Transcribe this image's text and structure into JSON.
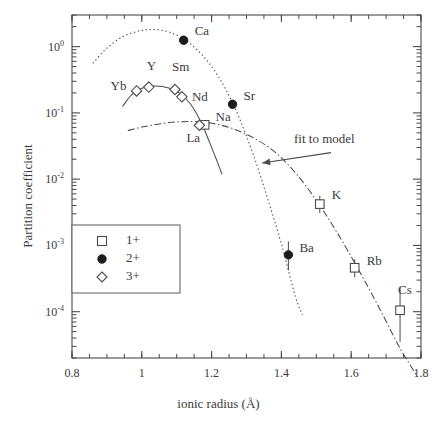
{
  "figure": {
    "xlabel": "ionic radius  (Å)",
    "ylabel": "Partition coefficient",
    "annotation": "fit to model"
  },
  "axes": {
    "x_ticks": [
      "0.8",
      "1",
      "1.2",
      "1.4",
      "1.6",
      "1.8"
    ],
    "x_tick_values": [
      0.8,
      1.0,
      1.2,
      1.4,
      1.6,
      1.8
    ],
    "y_ticks": [
      "10",
      "10",
      "10",
      "10",
      "10"
    ],
    "y_tick_exponents": [
      "0",
      "-1",
      "-2",
      "-3",
      "-4"
    ],
    "y_tick_values": [
      1,
      0.1,
      0.01,
      0.001,
      0.0001
    ]
  },
  "legend": {
    "items": [
      {
        "marker": "open-square",
        "label": "1+"
      },
      {
        "marker": "filled-circle",
        "label": "2+"
      },
      {
        "marker": "open-diamond",
        "label": "3+"
      }
    ]
  },
  "chart_data": {
    "type": "scatter",
    "title": "",
    "xlabel": "ionic radius  (Å)",
    "ylabel": "Partition coefficient",
    "xlim": [
      0.8,
      1.8
    ],
    "ylim": [
      2e-05,
      3.0
    ],
    "yscale": "log",
    "xscale": "linear",
    "grid": false,
    "legend_position": "lower-left",
    "annotations": [
      {
        "text": "fit to model",
        "x": 1.565,
        "y": 0.031,
        "arrow_to_x": 1.345,
        "arrow_to_y": 0.0175
      }
    ],
    "series": [
      {
        "name": "1+",
        "marker": "open-square",
        "points": [
          {
            "label": "Na",
            "x": 1.18,
            "y": 0.066,
            "yerr_low": null,
            "yerr_high": null
          },
          {
            "label": "K",
            "x": 1.51,
            "y": 0.0042,
            "yerr_low": 0.0031,
            "yerr_high": 0.0056
          },
          {
            "label": "Rb",
            "x": 1.61,
            "y": 0.00046,
            "yerr_low": 0.00033,
            "yerr_high": 0.00062
          },
          {
            "label": "Cs",
            "x": 1.74,
            "y": 0.000105,
            "yerr_low": 3.5e-05,
            "yerr_high": 0.00023
          }
        ]
      },
      {
        "name": "2+",
        "marker": "filled-circle",
        "points": [
          {
            "label": "Ca",
            "x": 1.12,
            "y": 1.25,
            "yerr_low": null,
            "yerr_high": null
          },
          {
            "label": "Sr",
            "x": 1.26,
            "y": 0.135,
            "yerr_low": null,
            "yerr_high": null
          },
          {
            "label": "Ba",
            "x": 1.42,
            "y": 0.00072,
            "yerr_low": 0.00042,
            "yerr_high": 0.00115
          }
        ]
      },
      {
        "name": "3+",
        "marker": "open-diamond",
        "points": [
          {
            "label": "Yb",
            "x": 0.985,
            "y": 0.215,
            "yerr_low": null,
            "yerr_high": null
          },
          {
            "label": "Y",
            "x": 1.02,
            "y": 0.245,
            "yerr_low": null,
            "yerr_high": null
          },
          {
            "label": "Sm",
            "x": 1.095,
            "y": 0.225,
            "yerr_low": null,
            "yerr_high": null
          },
          {
            "label": "Nd",
            "x": 1.115,
            "y": 0.175,
            "yerr_low": null,
            "yerr_high": null
          },
          {
            "label": "La",
            "x": 1.165,
            "y": 0.065,
            "yerr_low": null,
            "yerr_high": null
          }
        ]
      }
    ],
    "fit_curves": [
      {
        "name": "1+ fit",
        "style": "dash-dot",
        "x": [
          0.96,
          1.0,
          1.05,
          1.1,
          1.15,
          1.2,
          1.26,
          1.32,
          1.38,
          1.44,
          1.5,
          1.56,
          1.62,
          1.68,
          1.74,
          1.79
        ],
        "y": [
          0.054,
          0.061,
          0.068,
          0.073,
          0.074,
          0.07,
          0.058,
          0.042,
          0.026,
          0.0125,
          0.0048,
          0.00155,
          0.00044,
          0.000115,
          2.8e-05,
          1.05e-05
        ]
      },
      {
        "name": "2+ fit",
        "style": "dotted",
        "x": [
          0.86,
          0.9,
          0.95,
          1.0,
          1.04,
          1.08,
          1.12,
          1.16,
          1.2,
          1.24,
          1.28,
          1.32,
          1.36,
          1.4,
          1.44,
          1.46
        ],
        "y": [
          0.56,
          0.95,
          1.45,
          1.75,
          1.8,
          1.65,
          1.3,
          0.88,
          0.5,
          0.23,
          0.082,
          0.023,
          0.0052,
          0.00105,
          0.00017,
          9e-05
        ]
      },
      {
        "name": "3+ fit",
        "style": "solid",
        "x": [
          0.945,
          0.97,
          1.0,
          1.04,
          1.08,
          1.11,
          1.14,
          1.17,
          1.195,
          1.215,
          1.23
        ],
        "y": [
          0.125,
          0.185,
          0.235,
          0.255,
          0.235,
          0.195,
          0.135,
          0.072,
          0.035,
          0.019,
          0.0118
        ]
      }
    ]
  }
}
